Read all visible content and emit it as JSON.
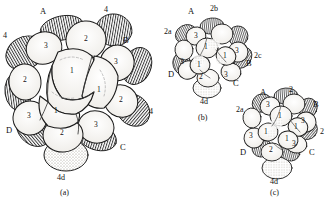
{
  "figure": {
    "line_color": "#1a1a1a",
    "fill_color": "#ffffff",
    "hatch_color": "#2a2a2a",
    "stipple_color": "#b8b2a8"
  },
  "panels": [
    {
      "caption": "(a)",
      "quadrants": [
        "A",
        "B",
        "C",
        "D"
      ],
      "tier_labels": [
        "4",
        "4"
      ],
      "micromere": "4d",
      "cells": [
        "3",
        "2",
        "2",
        "3",
        "1",
        "1",
        "1",
        "2",
        "3",
        "2",
        "1"
      ]
    },
    {
      "caption": "(b)",
      "quadrants": [
        "A",
        "B",
        "C",
        "D"
      ],
      "micromeres": [
        "2a",
        "2b",
        "2c",
        "4d"
      ],
      "cells": [
        "3",
        "3",
        "1",
        "1",
        "1",
        "3",
        "2",
        "3"
      ]
    },
    {
      "caption": "(c)",
      "quadrants": [
        "A",
        "B",
        "C",
        "D"
      ],
      "micromeres": [
        "2a",
        "4d"
      ],
      "tier_labels": [
        "2",
        "2"
      ],
      "cells": [
        "3",
        "1",
        "3",
        "1",
        "1",
        "3",
        "2",
        "3",
        "1"
      ]
    }
  ],
  "panel_a": {
    "caption": "(a)",
    "label_A": "A",
    "label_B": "B",
    "label_C": "C",
    "label_D": "D",
    "label_4_left": "4",
    "label_4_top": "4",
    "label_4_right": "4",
    "label_4d": "4d",
    "cell_3_tl": "3",
    "cell_2_tr": "2",
    "cell_2_l": "2",
    "cell_3_r": "3",
    "cell_1_c": "1",
    "cell_1_cr": "1",
    "cell_1_bl": "1",
    "cell_2_br": "2",
    "cell_3_bl": "3",
    "cell_2_b": "2",
    "cell_3_bc": "3"
  },
  "panel_b": {
    "caption": "(b)",
    "label_A": "A",
    "label_B": "B",
    "label_C": "C",
    "label_D": "D",
    "label_2a": "2a",
    "label_2b": "2b",
    "label_2c": "2c",
    "label_4d": "4d",
    "cell_3_t": "3",
    "cell_3_r": "3",
    "cell_1_c": "1",
    "cell_1_rc": "1",
    "cell_1_b": "1",
    "cell_3_l": "3",
    "cell_2_b": "2",
    "cell_3_br": "3"
  },
  "panel_c": {
    "caption": "(c)",
    "label_A": "A",
    "label_B": "B",
    "label_C": "C",
    "label_D": "D",
    "label_2a": "2a",
    "label_2_top": "2",
    "label_2_right": "2",
    "label_4d": "4d",
    "cell_3_t": "3",
    "cell_1_c": "1",
    "cell_3_r": "3",
    "cell_1_rc": "1",
    "cell_1_bl": "1",
    "cell_3_l": "3",
    "cell_2_b": "2",
    "cell_3_br": "3",
    "cell_1_b": "1"
  }
}
